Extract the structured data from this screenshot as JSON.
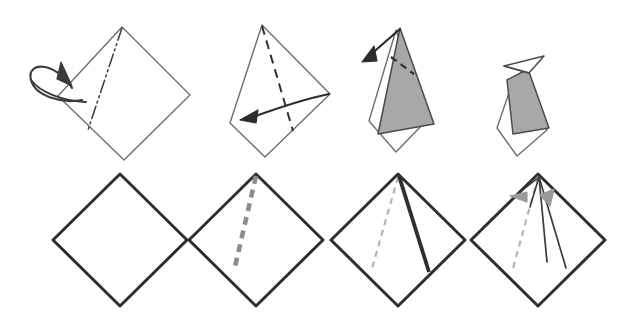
{
  "figure": {
    "title": "Origami folding sequence diagram",
    "canvas": {
      "width": 635,
      "height": 323,
      "background": "#ffffff"
    },
    "rows": [
      {
        "name": "top-row",
        "label": "folding steps",
        "panel_count": 4
      },
      {
        "name": "bottom-row",
        "label": "crease patterns",
        "panel_count": 4
      }
    ]
  },
  "colors": {
    "outline": "#3b3b3f",
    "outline_light": "#6e6e73",
    "crease_dark": "#2f2f33",
    "crease_gray": "#8c8c90",
    "crease_light": "#b4b4b8",
    "shaded_face": "#a8a8a8",
    "shaded_face_edge": "#4a4a4e",
    "arrow_dark": "#2b2b2f",
    "arrow_gray": "#9a9a9e",
    "paper_white": "#ffffff"
  },
  "line_styles": {
    "edge": {
      "name": "paper-edge",
      "dash": "none",
      "width": 1.4
    },
    "mountain": {
      "name": "mountain-fold",
      "dash": "14,4,2,4,2,4",
      "width": 1.5
    },
    "valley": {
      "name": "valley-fold",
      "dash": "9,6",
      "width": 1.9
    },
    "crease_thick_dashed": {
      "name": "thick-dashed-crease",
      "dash": "8,6",
      "width": 4.4
    },
    "crease_thin_dashed": {
      "name": "thin-dashed-crease",
      "dash": "6,5",
      "width": 2.0
    },
    "crease_solid_thick": {
      "name": "thick-solid-crease",
      "dash": "none",
      "width": 3.6
    },
    "crease_solid_thin": {
      "name": "thin-solid-crease",
      "dash": "none",
      "width": 1.6
    }
  },
  "top_row": {
    "panels": [
      {
        "id": "top-panel-1",
        "step": 1,
        "caption": "Square sheet with mountain crease, turn over",
        "shape": {
          "name": "square-diamond",
          "fill": "#ffffff",
          "points": "122,27 190,95 124,160 58,96"
        },
        "creases": [
          {
            "name": "mountain-fold-line",
            "style": "mountain",
            "color": "#3b3b3f",
            "path": "M 122,28 L 88,130"
          }
        ],
        "arrows": [
          {
            "name": "turn-over-arrow",
            "kind": "loop",
            "color": "#3b3b3f"
          }
        ]
      },
      {
        "id": "top-panel-2",
        "step": 2,
        "caption": "Kite form with valley fold, swing flap left",
        "shape": {
          "name": "kite-form",
          "fill": "#ffffff",
          "points": "262,25 330,94 265,157 230,123"
        },
        "creases": [
          {
            "name": "valley-fold-line",
            "style": "valley",
            "color": "#2f2f33",
            "path": "M 262,26 L 293,131"
          }
        ],
        "arrows": [
          {
            "name": "fold-left-arrow",
            "kind": "curved",
            "color": "#2b2b2f"
          }
        ]
      },
      {
        "id": "top-panel-3",
        "step": 3,
        "caption": "Narrow form with shaded face, fold tip out to upper left",
        "shape": {
          "name": "narrow-form-white",
          "fill": "#ffffff",
          "points": "398,28 428,120 398,150 368,120"
        },
        "shaded": {
          "name": "shaded-face",
          "fill": "#a8a8a8",
          "points": "400,28 433,123 377,133"
        },
        "creases": [
          {
            "name": "short-valley-fold",
            "style": "valley",
            "color": "#2f2f33",
            "path": "M 392,58 L 413,72"
          }
        ],
        "arrows": [
          {
            "name": "fold-out-arrow",
            "kind": "straight",
            "color": "#2b2b2f"
          }
        ]
      },
      {
        "id": "top-panel-4",
        "step": 4,
        "caption": "Completed form with beak folded to the left",
        "shape": {
          "name": "body-white",
          "fill": "#ffffff",
          "points": "517,77 545,128 517,155 497,128"
        },
        "shaded": {
          "name": "shaded-body",
          "fill": "#a8a8a8",
          "points": "528,70 547,127 515,133 508,80"
        },
        "beak": {
          "name": "beak-flap",
          "fill": "#ffffff",
          "points": "505,66 543,57 528,72"
        },
        "creases": [],
        "arrows": []
      }
    ]
  },
  "bottom_row": {
    "panels": [
      {
        "id": "bottom-panel-1",
        "step": 1,
        "caption": "Plain square, no creases",
        "diamond": {
          "name": "crease-diamond",
          "cx": 120,
          "cy": 240,
          "rx": 67,
          "ry": 66,
          "fill": "#ffffff"
        },
        "creases": []
      },
      {
        "id": "bottom-panel-2",
        "step": 2,
        "caption": "Square with one thick dashed crease",
        "diamond": {
          "name": "crease-diamond",
          "cx": 256,
          "cy": 240,
          "rx": 67,
          "ry": 66,
          "fill": "#ffffff"
        },
        "creases": [
          {
            "name": "thick-dashed-crease",
            "style": "crease_thick_dashed",
            "color": "#8c8c90",
            "path": "M 256,175 L 235,270"
          }
        ]
      },
      {
        "id": "bottom-panel-3",
        "step": 3,
        "caption": "Square with light dashed crease and thick solid crease",
        "diamond": {
          "name": "crease-diamond",
          "cx": 398,
          "cy": 240,
          "rx": 67,
          "ry": 66,
          "fill": "#ffffff"
        },
        "creases": [
          {
            "name": "thin-dashed-crease",
            "style": "crease_thin_dashed",
            "color": "#b4b4b8",
            "path": "M 398,176 L 371,272"
          },
          {
            "name": "thick-solid-crease",
            "style": "crease_solid_thick",
            "color": "#2f2f33",
            "path": "M 399,176 L 428,272"
          }
        ]
      },
      {
        "id": "bottom-panel-4",
        "step": 4,
        "caption": "Square with creases and gray fold-direction arrows",
        "diamond": {
          "name": "crease-diamond",
          "cx": 538,
          "cy": 240,
          "rx": 67,
          "ry": 66,
          "fill": "#ffffff"
        },
        "creases": [
          {
            "name": "thin-dashed-crease",
            "style": "crease_thin_dashed",
            "color": "#b4b4b8",
            "path": "M 538,176 L 512,272"
          },
          {
            "name": "thin-solid-crease-right",
            "style": "crease_solid_thin",
            "color": "#3b3b3f",
            "path": "M 539,177 L 564,268"
          },
          {
            "name": "thin-solid-crease-center",
            "style": "crease_solid_thin",
            "color": "#3b3b3f",
            "path": "M 539,177 L 545,262"
          },
          {
            "name": "thin-solid-crease-inner",
            "style": "crease_solid_thin",
            "color": "#3b3b3f",
            "path": "M 539,177 L 531,205"
          }
        ],
        "arrows": [
          {
            "name": "fold-arrow-left",
            "kind": "gray-head",
            "color": "#9a9a9e"
          },
          {
            "name": "fold-arrow-down",
            "kind": "gray-head",
            "color": "#9a9a9e"
          }
        ]
      }
    ]
  }
}
